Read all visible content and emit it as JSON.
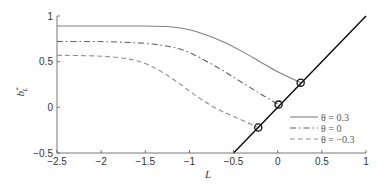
{
  "chart_data": {
    "type": "line",
    "title": "",
    "xlabel": "L",
    "ylabel": "b*_L",
    "xlim": [
      -2.5,
      1
    ],
    "ylim": [
      -0.5,
      1
    ],
    "xticks": [
      -2.5,
      -2,
      -1.5,
      -1,
      -0.5,
      0,
      0.5,
      1
    ],
    "xtick_labels": [
      "-2.5",
      "-2",
      "-1.5",
      "-1",
      "-0.5",
      "0",
      "0.5",
      "1"
    ],
    "yticks": [
      -0.5,
      0,
      0.5,
      1
    ],
    "ytick_labels": [
      "-0.5",
      "0",
      "0.5",
      "1"
    ],
    "grid": false,
    "legend_position": "lower right",
    "series": [
      {
        "name": "θ = 0.3",
        "style": "solid",
        "color": "#808080",
        "x": [
          -2.5,
          -2.0,
          -1.5,
          -1.2,
          -1.0,
          -0.8,
          -0.6,
          -0.4,
          -0.2,
          0.0,
          0.26
        ],
        "y": [
          0.89,
          0.89,
          0.89,
          0.88,
          0.85,
          0.79,
          0.71,
          0.61,
          0.5,
          0.39,
          0.27
        ]
      },
      {
        "name": "θ = 0",
        "style": "dashdot",
        "color": "#606060",
        "x": [
          -2.5,
          -2.0,
          -1.5,
          -1.2,
          -1.0,
          -0.8,
          -0.6,
          -0.4,
          -0.2,
          0.01
        ],
        "y": [
          0.72,
          0.72,
          0.7,
          0.66,
          0.6,
          0.5,
          0.39,
          0.27,
          0.15,
          0.03
        ]
      },
      {
        "name": "θ = -0.3",
        "style": "dashed",
        "color": "#909090",
        "x": [
          -2.5,
          -2.0,
          -1.7,
          -1.5,
          -1.3,
          -1.1,
          -0.9,
          -0.7,
          -0.5,
          -0.22
        ],
        "y": [
          0.57,
          0.56,
          0.53,
          0.48,
          0.38,
          0.25,
          0.11,
          -0.01,
          -0.1,
          -0.22
        ]
      },
      {
        "name": "b = L",
        "style": "solid",
        "color": "#000000",
        "x": [
          -0.5,
          1.0
        ],
        "y": [
          -0.5,
          1.0
        ],
        "in_legend": false
      }
    ],
    "markers": [
      {
        "series": "θ = 0.3",
        "x": 0.26,
        "y": 0.27,
        "shape": "circle"
      },
      {
        "series": "θ = 0",
        "x": 0.01,
        "y": 0.03,
        "shape": "circle"
      },
      {
        "series": "θ = -0.3",
        "x": -0.22,
        "y": -0.22,
        "shape": "circle"
      }
    ]
  },
  "legend": {
    "items": [
      "θ = 0.3",
      "θ = 0",
      "θ = −0.3"
    ]
  },
  "axes": {
    "xlabel": "L",
    "ylabel_main": "b",
    "ylabel_sup": "*",
    "ylabel_sub": "L"
  }
}
